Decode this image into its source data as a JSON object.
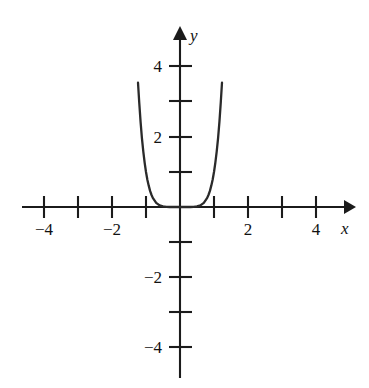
{
  "figure": {
    "background_color": "#ffffff",
    "ink_color": "#1b1b1b",
    "curve_color": "#2a2a2a",
    "width": 369,
    "height": 388
  },
  "axes": {
    "x_axis_label": "x",
    "y_axis_label": "y",
    "origin_px": {
      "x": 180,
      "y": 207
    },
    "px_per_unit_x": 34,
    "px_per_unit_y": 35,
    "x_tick_values": [
      -4,
      -3,
      -2,
      -1,
      1,
      2,
      3,
      4
    ],
    "y_tick_values": [
      4,
      3,
      2,
      1,
      -1,
      -2,
      -3,
      -4
    ],
    "x_labeled_ticks": [
      {
        "value": -4,
        "text": "−4"
      },
      {
        "value": -2,
        "text": "−2"
      },
      {
        "value": 2,
        "text": "2"
      },
      {
        "value": 4,
        "text": "4"
      }
    ],
    "y_labeled_ticks": [
      {
        "value": 4,
        "text": "4"
      },
      {
        "value": 2,
        "text": "2"
      },
      {
        "value": -2,
        "text": "−2"
      },
      {
        "value": -4,
        "text": "−4"
      }
    ],
    "x_arrow_direction": "right",
    "y_arrow_direction": "up"
  },
  "chart_data": {
    "type": "line",
    "title": "",
    "subtitle": "",
    "xlabel": "x",
    "ylabel": "y",
    "xlim": [
      -5,
      5
    ],
    "ylim": [
      -5,
      5
    ],
    "grid": false,
    "legend": false,
    "legend_position": "none",
    "xticks": [
      -4,
      -3,
      -2,
      -1,
      0,
      1,
      2,
      3,
      4
    ],
    "yticks": [
      -4,
      -3,
      -2,
      -1,
      0,
      1,
      2,
      3,
      4
    ],
    "xticklabels": [
      "−4",
      "",
      "−2",
      "",
      "",
      "",
      "2",
      "",
      "4"
    ],
    "yticklabels": [
      "−4",
      "",
      "−2",
      "",
      "",
      "",
      "2",
      "",
      "4"
    ],
    "annotations": [],
    "series": [
      {
        "name": "y = x^6",
        "equation": "y = x^6",
        "color": "#2a2a2a",
        "x": [
          -1.235,
          -1.2,
          -1.16,
          -1.12,
          -1.08,
          -1.04,
          -1.0,
          -0.96,
          -0.92,
          -0.88,
          -0.84,
          -0.8,
          -0.7,
          -0.6,
          -0.5,
          -0.4,
          -0.3,
          -0.2,
          -0.1,
          0.0,
          0.1,
          0.2,
          0.3,
          0.4,
          0.5,
          0.6,
          0.7,
          0.8,
          0.84,
          0.88,
          0.92,
          0.96,
          1.0,
          1.04,
          1.08,
          1.12,
          1.16,
          1.2,
          1.235
        ],
        "y": [
          3.55,
          3.0,
          2.44,
          1.97,
          1.59,
          1.27,
          1.0,
          0.78,
          0.61,
          0.46,
          0.35,
          0.26,
          0.12,
          0.047,
          0.016,
          0.004,
          0.0007,
          6e-05,
          1e-06,
          0.0,
          1e-06,
          6e-05,
          0.0007,
          0.004,
          0.016,
          0.047,
          0.12,
          0.26,
          0.35,
          0.46,
          0.61,
          0.78,
          1.0,
          1.27,
          1.59,
          1.97,
          2.44,
          3.0,
          3.55
        ]
      }
    ]
  }
}
